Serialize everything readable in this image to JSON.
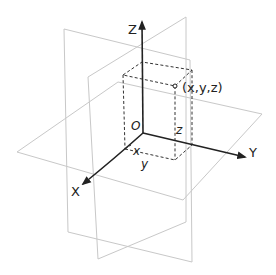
{
  "diagram": {
    "axes": {
      "x_label": "X",
      "y_label": "Y",
      "z_label": "Z",
      "origin_label": "O"
    },
    "point": {
      "label": "(x,y,z)"
    },
    "components": {
      "x_label": "x",
      "y_label": "y",
      "z_label": "z"
    },
    "planes": [
      "XY-plane",
      "XZ-plane",
      "YZ-plane"
    ],
    "colors": {
      "axis": "#222222",
      "plane": "#c8c8c8",
      "dashed_box": "#333333",
      "background": "#ffffff"
    }
  }
}
